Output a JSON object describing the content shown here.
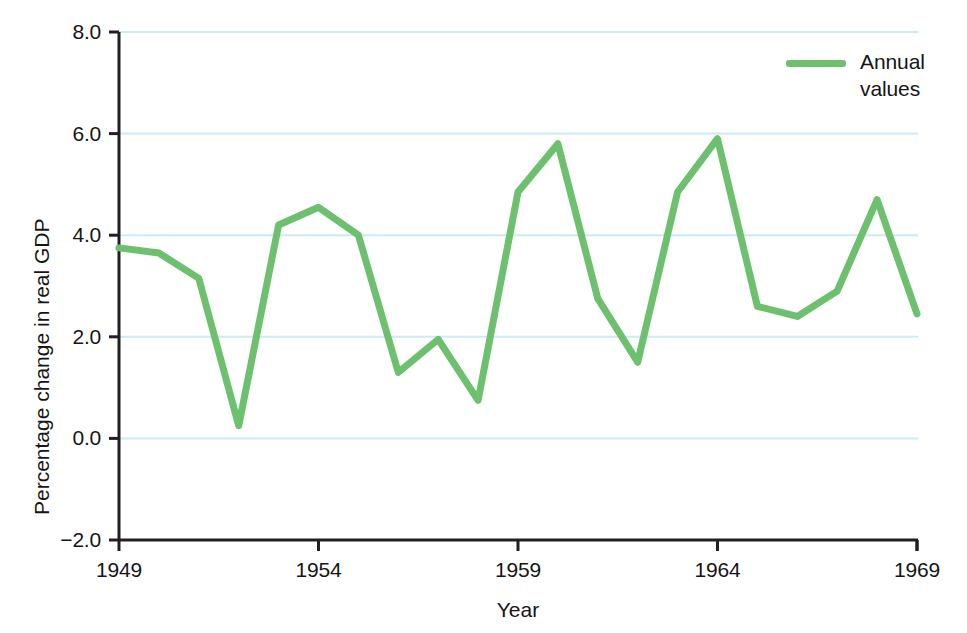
{
  "chart_data": {
    "type": "line",
    "title": "",
    "xlabel": "Year",
    "ylabel": "Percentage change in real GDP",
    "xlim": [
      1949,
      1969
    ],
    "ylim": [
      -2.0,
      8.0
    ],
    "grid": true,
    "grid_axis": "y",
    "legend_position": "top-right",
    "x_tick_labels": [
      "1949",
      "1954",
      "1959",
      "1964",
      "1969"
    ],
    "x_ticks": [
      1949,
      1954,
      1959,
      1964,
      1969
    ],
    "y_tick_labels": [
      "8.0",
      "6.0",
      "4.0",
      "2.0",
      "0.0",
      "−2.0"
    ],
    "y_ticks": [
      8.0,
      6.0,
      4.0,
      2.0,
      0.0,
      -2.0
    ],
    "x": [
      1949,
      1950,
      1951,
      1952,
      1953,
      1954,
      1955,
      1956,
      1957,
      1958,
      1959,
      1960,
      1961,
      1962,
      1963,
      1964,
      1965,
      1966,
      1967,
      1968,
      1969
    ],
    "series": [
      {
        "name": "Annual values",
        "color": "#6dc06d",
        "values": [
          3.75,
          3.65,
          3.15,
          0.25,
          4.2,
          4.55,
          4.0,
          1.3,
          1.95,
          0.75,
          4.85,
          5.8,
          2.75,
          1.5,
          4.85,
          5.9,
          2.6,
          2.4,
          2.9,
          4.7,
          2.45
        ]
      }
    ]
  },
  "legend": {
    "entries": [
      {
        "label": "Annual\nvalues",
        "color": "#6dc06d"
      }
    ]
  },
  "axes": {
    "x_title": "Year",
    "y_title": "Percentage change in real GDP"
  },
  "colors": {
    "line": "#6dc06d",
    "grid": "#cdeaf5",
    "axis": "#231f20",
    "text": "#151515",
    "background": "#ffffff"
  }
}
